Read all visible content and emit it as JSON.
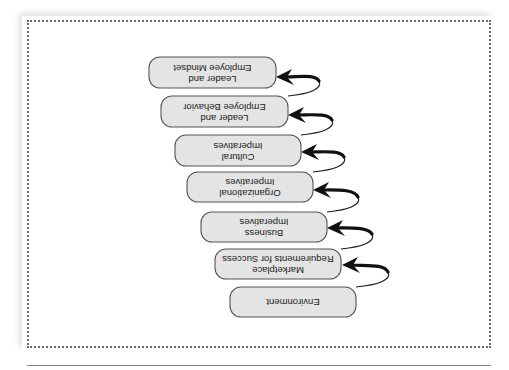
{
  "diagram": {
    "orientation": "rotated-180",
    "colors": {
      "box_fill": "#e4e4e4",
      "box_stroke": "#555555",
      "arrow": "#111111",
      "frame": "#6a6a6a"
    },
    "steps": [
      {
        "id": 1,
        "line1": "Environment",
        "line2": ""
      },
      {
        "id": 2,
        "line1": "Marketplace",
        "line2": "Requirements for Success"
      },
      {
        "id": 3,
        "line1": "Business",
        "line2": "Imperatives"
      },
      {
        "id": 4,
        "line1": "Organizational",
        "line2": "Imperatives"
      },
      {
        "id": 5,
        "line1": "Cultural",
        "line2": "Imperatives"
      },
      {
        "id": 6,
        "line1": "Leader and",
        "line2": "Employee Behavior"
      },
      {
        "id": 7,
        "line1": "Leader and",
        "line2": "Employee Mindset"
      }
    ],
    "connections": [
      {
        "from": 1,
        "to": 2
      },
      {
        "from": 2,
        "to": 3
      },
      {
        "from": 3,
        "to": 4
      },
      {
        "from": 4,
        "to": 5
      },
      {
        "from": 5,
        "to": 6
      },
      {
        "from": 6,
        "to": 7
      }
    ]
  }
}
